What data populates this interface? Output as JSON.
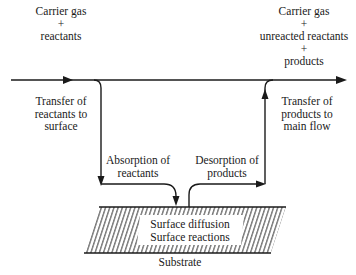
{
  "diagram": {
    "type": "process-flow",
    "title": "",
    "inlet_label": [
      "Carrier gas",
      "+",
      "reactants"
    ],
    "outlet_label": [
      "Carrier gas",
      "+",
      "unreacted reactants",
      "+",
      "products"
    ],
    "steps": {
      "transfer_in": [
        "Transfer of",
        "reactants to",
        "surface"
      ],
      "absorption": [
        "Absorption of",
        "reactants"
      ],
      "desorption": [
        "Desorption of",
        "products"
      ],
      "transfer_out": [
        "Transfer of",
        "products to",
        "main flow"
      ]
    },
    "substrate": {
      "inner_text": [
        "Surface diffusion",
        "Surface reactions"
      ],
      "label": "Substrate"
    },
    "colors": {
      "line": "#1a1a1a",
      "background": "#ffffff"
    }
  }
}
